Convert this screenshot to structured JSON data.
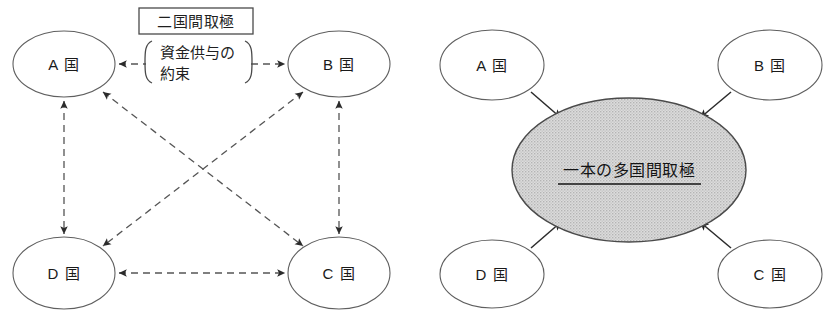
{
  "figure": {
    "title": "",
    "panels": [
      {
        "id": "bilateral",
        "caption": "",
        "nodes": [
          {
            "id": "a",
            "label": "A 国",
            "cx": 64,
            "cy": 64,
            "rx": 51,
            "ry": 33
          },
          {
            "id": "b",
            "label": "B 国",
            "cx": 339,
            "cy": 64,
            "rx": 51,
            "ry": 33
          },
          {
            "id": "c",
            "label": "C 国",
            "cx": 339,
            "cy": 273,
            "rx": 51,
            "ry": 36
          },
          {
            "id": "d",
            "label": "D 国",
            "cx": 64,
            "cy": 273,
            "rx": 51,
            "ry": 36
          }
        ],
        "box_label": "二国間取極",
        "bracket_label_line1": "資金供与の",
        "bracket_label_line2": "約束",
        "edges": [
          {
            "from": "a",
            "to": "b",
            "style": "dashed",
            "heads": "both"
          },
          {
            "from": "d",
            "to": "c",
            "style": "dashed",
            "heads": "both"
          },
          {
            "from": "a",
            "to": "d",
            "style": "dashed",
            "heads": "both"
          },
          {
            "from": "b",
            "to": "c",
            "style": "dashed",
            "heads": "both"
          },
          {
            "from": "a",
            "to": "c",
            "style": "dashed",
            "heads": "both"
          },
          {
            "from": "b",
            "to": "d",
            "style": "dashed",
            "heads": "both"
          }
        ]
      },
      {
        "id": "multilateral",
        "caption": "",
        "nodes": [
          {
            "id": "a",
            "label": "A 国",
            "cx": 492,
            "cy": 65,
            "rx": 52,
            "ry": 35
          },
          {
            "id": "b",
            "label": "B 国",
            "cx": 770,
            "cy": 65,
            "rx": 52,
            "ry": 35
          },
          {
            "id": "c",
            "label": "C 国",
            "cx": 770,
            "cy": 274,
            "rx": 52,
            "ry": 34
          },
          {
            "id": "d",
            "label": "D 国",
            "cx": 492,
            "cy": 274,
            "rx": 52,
            "ry": 34
          }
        ],
        "hub": {
          "label": "一本の多国間取極",
          "cx": 629,
          "cy": 170,
          "rx": 117,
          "ry": 72,
          "fill": "#d4d4d4",
          "underline": true
        },
        "edges": [
          {
            "from": "a",
            "to": "hub",
            "style": "solid",
            "heads": "to"
          },
          {
            "from": "b",
            "to": "hub",
            "style": "solid",
            "heads": "to"
          },
          {
            "from": "c",
            "to": "hub",
            "style": "solid",
            "heads": "to"
          },
          {
            "from": "d",
            "to": "hub",
            "style": "solid",
            "heads": "to"
          }
        ]
      }
    ],
    "colors": {
      "background": "#ffffff",
      "node_stroke": "#5f5f5f",
      "edge_dashed": "#555555",
      "edge_solid": "#2b2b2b",
      "hub_fill": "#d4d4d4",
      "text": "#1a1a1a"
    }
  }
}
